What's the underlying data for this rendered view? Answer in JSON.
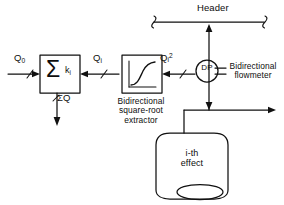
{
  "diagram": {
    "stroke_color": "#111111",
    "background": "#ffffff"
  },
  "labels": {
    "header": "Header",
    "q_zero": "Q",
    "q_zero_sub": "0",
    "q_i": "Q",
    "q_i_sub": "i",
    "q_i_sq": "Q",
    "q_i_sq_sub": "i",
    "q_i_sq_sup": "2",
    "sum_q": "ΣQ",
    "dp": "DP",
    "sqrt_extractor_line1": "Bidirectional",
    "sqrt_extractor_line2": "square-root",
    "sqrt_extractor_line3": "extractor",
    "flowmeter_line1": "Bidirectional",
    "flowmeter_line2": "flowmeter",
    "effect_line1": "i-th",
    "effect_line2": "effect",
    "summer_symbol": "Σ",
    "summer_gain": "k",
    "summer_gain_sub": "i"
  },
  "blocks": {
    "summer": {
      "name": "summing-junction",
      "x": 40,
      "y": 55,
      "w": 40,
      "h": 38
    },
    "sqrt_extractor": {
      "name": "square-root-extractor",
      "x": 122,
      "y": 55,
      "w": 40,
      "h": 38
    },
    "dp_transmitter": {
      "name": "dp-transmitter",
      "cx": 207,
      "cy": 71,
      "r": 11
    },
    "effect_vessel": {
      "name": "i-th-effect-vessel",
      "x": 156,
      "y": 133,
      "w": 72,
      "h": 66
    }
  },
  "connections": [
    {
      "name": "q0-to-summer",
      "from": "inlet",
      "to": "summer",
      "direction": "right"
    },
    {
      "name": "qi-to-summer",
      "from": "sqrt-extractor",
      "to": "summer",
      "direction": "left"
    },
    {
      "name": "qi2-to-sqrt",
      "from": "dp-transmitter",
      "to": "sqrt-extractor",
      "direction": "left"
    },
    {
      "name": "sumq-out",
      "from": "summer",
      "to": "outlet",
      "direction": "down"
    },
    {
      "name": "riser-to-header",
      "from": "vessel-line",
      "to": "header",
      "direction": "up"
    },
    {
      "name": "vessel-to-riser",
      "from": "effect-vessel",
      "to": "riser",
      "direction": "right"
    }
  ]
}
